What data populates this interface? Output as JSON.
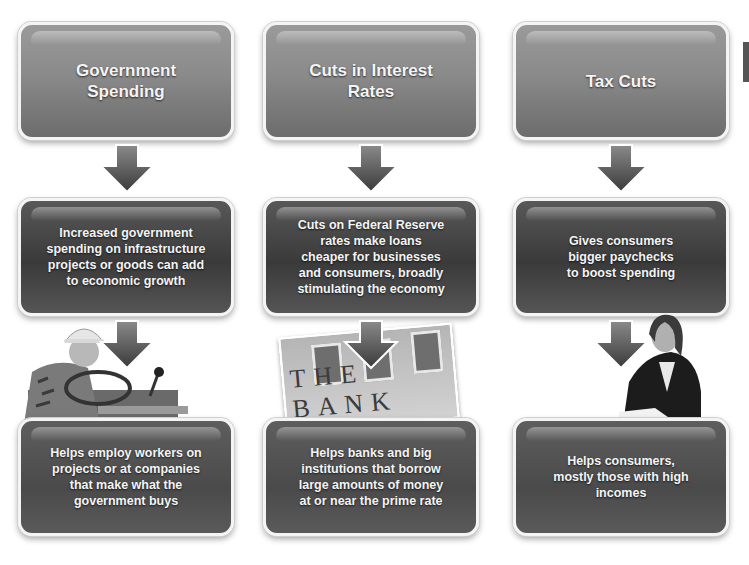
{
  "diagram": {
    "columns": [
      {
        "title": "Government\nSpending",
        "effect": "Increased government\nspending on infrastructure\nprojects or goods can add\nto economic growth",
        "beneficiaries": "Helps employ workers on\nprojects or at companies\nthat make what the\ngovernment buys",
        "photo": "construction-worker-on-tractor"
      },
      {
        "title": "Cuts in Interest\nRates",
        "effect": "Cuts on Federal Reserve\nrates make loans\ncheaper for businesses\nand consumers, broadly\nstimulating the economy",
        "beneficiaries": "Helps banks and big\ninstitutions that borrow\nlarge amounts of money\nat or near the prime rate",
        "photo": "bank-building-facade",
        "photo_text": "THE BANK"
      },
      {
        "title": "Tax Cuts",
        "effect": "Gives consumers\nbigger paychecks\nto boost spending",
        "beneficiaries": "Helps consumers,\nmostly those with high\nincomes",
        "photo": "woman-reviewing-paperwork"
      }
    ]
  }
}
